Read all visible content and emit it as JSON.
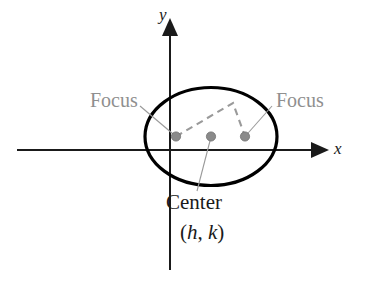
{
  "figure": {
    "type": "geometry-diagram",
    "background_color": "#ffffff"
  },
  "axes": {
    "x_label": "x",
    "y_label": "y",
    "axis_color": "#1a1a1a",
    "x_axis": {
      "x_start": 17,
      "x_end": 318,
      "y": 150,
      "arrow": "right"
    },
    "y_axis": {
      "y_start": 30,
      "y_end": 270,
      "x": 170,
      "arrow": "up"
    }
  },
  "ellipse": {
    "center_x": 211,
    "center_y": 136.5,
    "radius_x": 66,
    "radius_y": 49,
    "stroke_color": "#000000",
    "stroke_width": 3.2,
    "fill": "none"
  },
  "points": {
    "dot_color": "#8a8a8a",
    "dot_edge_color": "#6f6f6f",
    "dot_radius": 4.6,
    "focus_left": {
      "x": 176,
      "y": 136.5
    },
    "center": {
      "x": 211,
      "y": 136.5
    },
    "focus_right": {
      "x": 245,
      "y": 136.5
    }
  },
  "dashed_rays": {
    "color": "#9a9a9a",
    "stroke_width": 2.1,
    "dash": "7 5",
    "apex": {
      "x": 233,
      "y": 103
    },
    "from_focus_left": {
      "x": 176,
      "y": 136.5
    },
    "to_focus_right": {
      "x": 245,
      "y": 136.5
    }
  },
  "leaders": {
    "color": "#9a9a9a",
    "stroke_width": 1.1,
    "focus_left": {
      "x1": 140,
      "y1": 106,
      "x2": 176,
      "y2": 136.5
    },
    "focus_right": {
      "x1": 272,
      "y1": 106,
      "x2": 245,
      "y2": 136.5
    },
    "center": {
      "x1": 197,
      "y1": 191,
      "x2": 211,
      "y2": 137
    }
  },
  "labels": {
    "focus_left": "Focus",
    "focus_right": "Focus",
    "center_word": "Center",
    "center_coords_open": "(",
    "center_coords_h": "h",
    "center_coords_comma": ", ",
    "center_coords_k": "k",
    "center_coords_close": ")",
    "center_coords_full": "(h, k)",
    "label_color": "#8f8f8f",
    "center_label_color": "#1a1a1a"
  }
}
